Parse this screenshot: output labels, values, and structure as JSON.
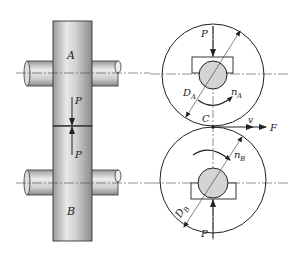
{
  "diagram": {
    "left_view": {
      "roller_a_label": "A",
      "roller_b_label": "B",
      "force_top_label": "P",
      "force_bottom_label": "P"
    },
    "right_view": {
      "force_top_label": "P",
      "force_bottom_label": "P",
      "diameter_a_label": "D",
      "diameter_a_sub": "A",
      "diameter_b_label": "D",
      "diameter_b_sub": "B",
      "speed_a_label": "n",
      "speed_a_sub": "A",
      "speed_b_label": "n",
      "speed_b_sub": "B",
      "contact_label": "C",
      "velocity_label": "v",
      "friction_force_label": "F"
    }
  }
}
